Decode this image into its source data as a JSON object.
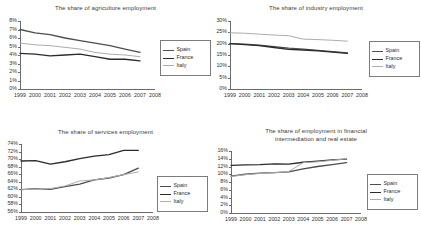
{
  "series_colors": {
    "Spain": "#4d4d4d",
    "France": "#2b2b2b",
    "Italy": "#adadad"
  },
  "legend": {
    "spain_label": "Spain",
    "france_label": "France",
    "italy_label": "Italy"
  },
  "chart_data": [
    {
      "id": "agriculture",
      "type": "line",
      "title": "The share of agriculture employment",
      "xlabel": "",
      "ylabel": "",
      "x": [
        1999,
        2000,
        2001,
        2002,
        2003,
        2004,
        2005,
        2006,
        2007
      ],
      "xtick_labels": [
        "1999",
        "2000",
        "2001",
        "2002",
        "2003",
        "2004",
        "2005",
        "2006",
        "2007",
        "2008"
      ],
      "xlim": [
        1999,
        2008
      ],
      "ylim": [
        0,
        8
      ],
      "ytick_labels": [
        "8%",
        "7%",
        "6%",
        "5%",
        "4%",
        "3%",
        "2%",
        "1%",
        "0%"
      ],
      "yticks": [
        8,
        7,
        6,
        5,
        4,
        3,
        2,
        1,
        0
      ],
      "grid": false,
      "legend_position": "right",
      "series": [
        {
          "name": "Spain",
          "values": [
            7.0,
            6.6,
            6.4,
            6.0,
            5.7,
            5.4,
            5.1,
            4.7,
            4.3
          ]
        },
        {
          "name": "France",
          "values": [
            4.2,
            4.1,
            3.9,
            4.0,
            4.1,
            3.8,
            3.5,
            3.5,
            3.3
          ]
        },
        {
          "name": "Italy",
          "values": [
            5.4,
            5.2,
            5.1,
            4.9,
            4.7,
            4.3,
            4.1,
            4.0,
            3.8
          ]
        }
      ]
    },
    {
      "id": "industry",
      "type": "line",
      "title": "The share of industry employment",
      "xlabel": "",
      "ylabel": "",
      "x": [
        1999,
        2000,
        2001,
        2002,
        2003,
        2004,
        2005,
        2006,
        2007
      ],
      "xtick_labels": [
        "1999",
        "2000",
        "2001",
        "2002",
        "2003",
        "2004",
        "2005",
        "2006",
        "2007",
        "2008"
      ],
      "xlim": [
        1999,
        2008
      ],
      "ylim": [
        0,
        30
      ],
      "ytick_labels": [
        "30%",
        "25%",
        "20%",
        "15%",
        "10%",
        "5%",
        "0%"
      ],
      "yticks": [
        30,
        25,
        20,
        15,
        10,
        5,
        0
      ],
      "grid": false,
      "legend_position": "right",
      "series": [
        {
          "name": "Spain",
          "values": [
            20.0,
            19.8,
            19.3,
            18.7,
            18.0,
            17.6,
            17.0,
            16.5,
            15.9
          ]
        },
        {
          "name": "France",
          "values": [
            20.0,
            19.6,
            19.1,
            18.3,
            17.5,
            17.2,
            16.8,
            16.3,
            15.7
          ]
        },
        {
          "name": "Italy",
          "values": [
            24.8,
            24.6,
            24.2,
            23.8,
            23.5,
            22.0,
            21.8,
            21.5,
            21.1
          ]
        }
      ]
    },
    {
      "id": "services",
      "type": "line",
      "title": "The share of services employment",
      "xlabel": "",
      "ylabel": "",
      "x": [
        1999,
        2000,
        2001,
        2002,
        2003,
        2004,
        2005,
        2006,
        2007
      ],
      "xtick_labels": [
        "1999",
        "2000",
        "2001",
        "2002",
        "2003",
        "2004",
        "2005",
        "2006",
        "2007",
        "2008"
      ],
      "xlim": [
        1999,
        2008
      ],
      "ylim": [
        56,
        74
      ],
      "ytick_labels": [
        "74%",
        "72%",
        "70%",
        "68%",
        "66%",
        "64%",
        "62%",
        "60%",
        "58%",
        "56%"
      ],
      "yticks": [
        74,
        72,
        70,
        68,
        66,
        64,
        62,
        60,
        58,
        56
      ],
      "grid": false,
      "legend_position": "right",
      "series": [
        {
          "name": "Spain",
          "values": [
            61.9,
            62.2,
            62.0,
            62.7,
            63.4,
            64.5,
            65.0,
            65.9,
            67.6
          ]
        },
        {
          "name": "France",
          "values": [
            69.5,
            69.6,
            68.7,
            69.3,
            70.1,
            70.8,
            71.2,
            72.3,
            72.3
          ]
        },
        {
          "name": "Italy",
          "values": [
            61.9,
            62.1,
            62.2,
            62.9,
            64.2,
            64.5,
            65.1,
            65.9,
            66.6
          ]
        }
      ]
    },
    {
      "id": "finance-realestate",
      "type": "line",
      "title_line1": "The share of employment in financial",
      "title_line2": "intermediation and real estate",
      "title": "The share of employment in financial intermediation and real estate",
      "xlabel": "",
      "ylabel": "",
      "x": [
        1999,
        2000,
        2001,
        2002,
        2003,
        2004,
        2005,
        2006,
        2007
      ],
      "xtick_labels": [
        "1999",
        "2000",
        "2001",
        "2002",
        "2003",
        "2004",
        "2005",
        "2006",
        "2007",
        "2008"
      ],
      "xlim": [
        1999,
        2008
      ],
      "ylim": [
        0,
        16
      ],
      "ytick_labels": [
        "16%",
        "14%",
        "12%",
        "10%",
        "8%",
        "6%",
        "4%",
        "2%",
        "0%"
      ],
      "yticks": [
        16,
        14,
        12,
        10,
        8,
        6,
        4,
        2,
        0
      ],
      "grid": false,
      "legend_position": "right",
      "series": [
        {
          "name": "Spain",
          "values": [
            9.5,
            10.0,
            10.3,
            10.4,
            10.6,
            11.4,
            12.0,
            12.5,
            13.0
          ]
        },
        {
          "name": "France",
          "values": [
            12.3,
            12.4,
            12.5,
            12.7,
            12.6,
            13.1,
            13.4,
            13.7,
            13.9
          ]
        },
        {
          "name": "Italy",
          "values": [
            9.4,
            9.9,
            10.2,
            10.4,
            10.7,
            13.0,
            13.2,
            13.6,
            14.0
          ]
        }
      ]
    }
  ]
}
